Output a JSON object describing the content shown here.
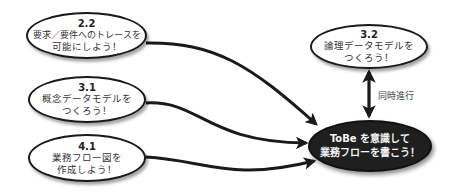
{
  "diagram": {
    "nodes": [
      {
        "id": "2.2",
        "number": "2.2",
        "line1": "要求／要件へのトレースを",
        "line2": "可能にしよう！"
      },
      {
        "id": "3.1",
        "number": "3.1",
        "line1": "概念データモデルを",
        "line2": "つくろう！"
      },
      {
        "id": "4.1",
        "number": "4.1",
        "line1": "業務フロー図を",
        "line2": "作成しよう！"
      },
      {
        "id": "3.2",
        "number": "3.2",
        "line1": "論理データモデルを",
        "line2": "つくろう！"
      },
      {
        "id": "goal",
        "line1": "ToBe を意識して",
        "line2": "業務フローを書こう！"
      }
    ],
    "edges": [
      {
        "from": "2.2",
        "to": "goal",
        "type": "arrow"
      },
      {
        "from": "3.1",
        "to": "goal",
        "type": "arrow"
      },
      {
        "from": "4.1",
        "to": "goal",
        "type": "arrow"
      },
      {
        "from": "3.2",
        "to": "goal",
        "type": "bidirectional",
        "label": "同時進行"
      }
    ],
    "colors": {
      "stroke": "#1a1a1a",
      "dark_fill": "#1f1f1f",
      "light_fill": "#ffffff",
      "dark_text": "#f4f4f4"
    }
  }
}
